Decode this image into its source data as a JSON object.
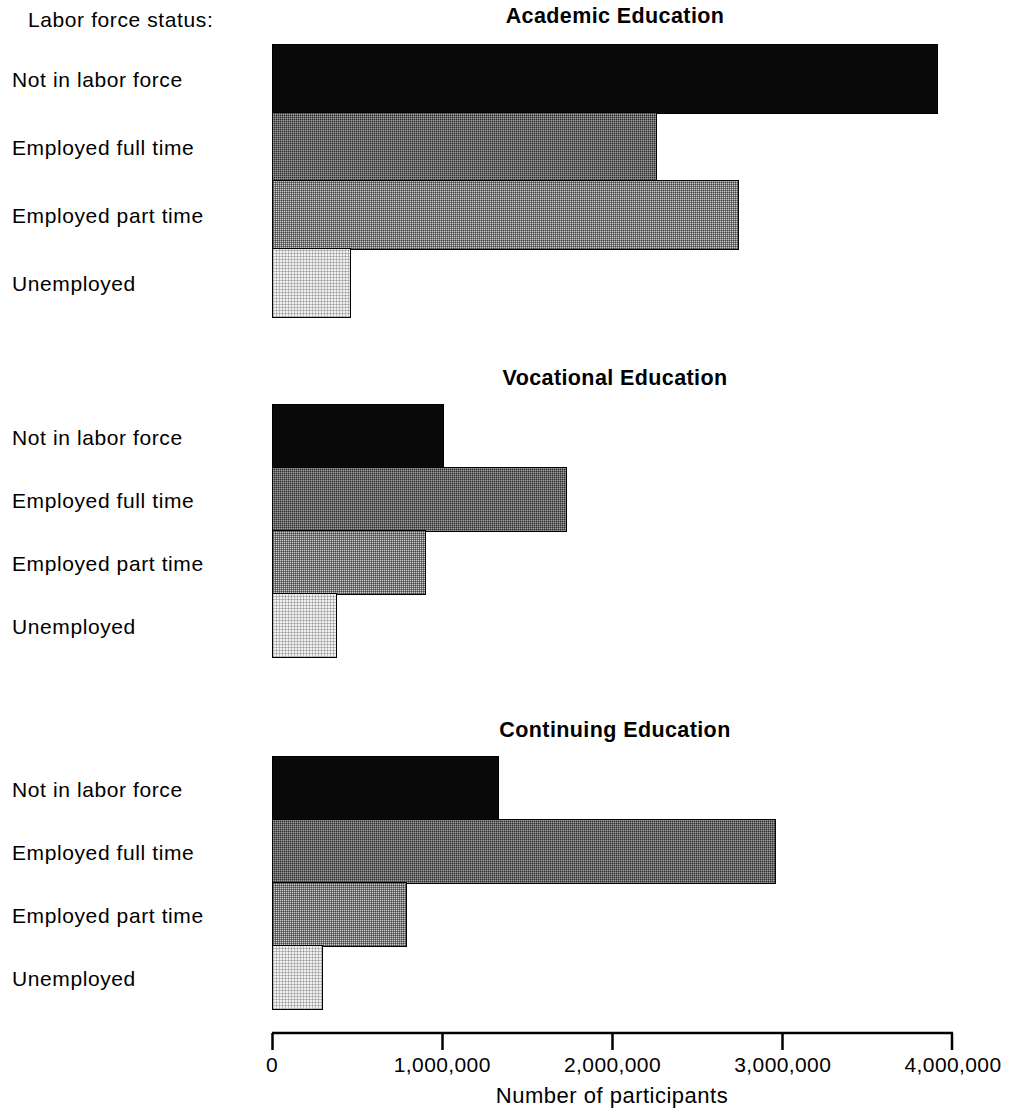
{
  "legend_caption": "Labor force status:",
  "categories": [
    "Not in labor force",
    "Employed full time",
    "Employed part time",
    "Unemployed"
  ],
  "axis": {
    "title": "Number of participants",
    "ticks": [
      "0",
      "1,000,000",
      "2,000,000",
      "3,000,000",
      "4,000,000"
    ],
    "tick_values": [
      0,
      1000000,
      2000000,
      3000000,
      4000000
    ],
    "min": 0,
    "max": 4000000
  },
  "panels": [
    {
      "title": "Academic Education",
      "values": [
        3900000,
        2250000,
        2730000,
        450000
      ]
    },
    {
      "title": "Vocational Education",
      "values": [
        1000000,
        1720000,
        890000,
        370000
      ]
    },
    {
      "title": "Continuing Education",
      "values": [
        1320000,
        2950000,
        780000,
        290000
      ]
    }
  ],
  "chart_data": {
    "type": "bar",
    "orientation": "horizontal",
    "title": "",
    "xlabel": "Number of participants",
    "ylabel": "Labor force status:",
    "xlim": [
      0,
      4000000
    ],
    "xticks": [
      0,
      1000000,
      2000000,
      3000000,
      4000000
    ],
    "xticklabels": [
      "0",
      "1,000,000",
      "2,000,000",
      "3,000,000",
      "4,000,000"
    ],
    "grid": false,
    "legend": "none",
    "categories": [
      "Not in labor force",
      "Employed full time",
      "Employed part time",
      "Unemployed"
    ],
    "panels": [
      {
        "title": "Academic Education",
        "series": [
          {
            "name": "Number of participants",
            "values": [
              3900000,
              2250000,
              2730000,
              450000
            ]
          }
        ]
      },
      {
        "title": "Vocational Education",
        "series": [
          {
            "name": "Number of participants",
            "values": [
              1000000,
              1720000,
              890000,
              370000
            ]
          }
        ]
      },
      {
        "title": "Continuing Education",
        "series": [
          {
            "name": "Number of participants",
            "values": [
              1320000,
              2950000,
              780000,
              290000
            ]
          }
        ]
      }
    ],
    "bar_fills": [
      "solid-black",
      "dark-gray-hatch",
      "light-gray-hatch",
      "very-light-gray-hatch"
    ]
  }
}
